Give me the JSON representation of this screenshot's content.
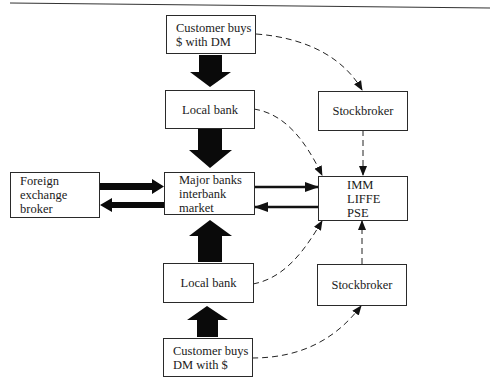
{
  "diagram": {
    "nodes": {
      "customer_top": {
        "lines": [
          "Customer buys",
          "$ with DM"
        ]
      },
      "local_bank_top": {
        "label": "Local bank"
      },
      "stockbroker_top": {
        "label": "Stockbroker"
      },
      "fx_broker": {
        "lines": [
          "Foreign",
          "exchange",
          "broker"
        ]
      },
      "major_banks": {
        "lines": [
          "Major banks",
          "interbank",
          "market"
        ]
      },
      "exchanges": {
        "lines": [
          "IMM",
          "LIFFE",
          "PSE"
        ]
      },
      "local_bank_bottom": {
        "label": "Local bank"
      },
      "stockbroker_bottom": {
        "label": "Stockbroker"
      },
      "customer_bottom": {
        "lines": [
          "Customer buys",
          "DM with $"
        ]
      }
    },
    "edges": [
      {
        "from": "customer_top",
        "to": "local_bank_top",
        "style": "thick-solid"
      },
      {
        "from": "local_bank_top",
        "to": "major_banks",
        "style": "thick-solid"
      },
      {
        "from": "local_bank_bottom",
        "to": "major_banks",
        "style": "thick-solid"
      },
      {
        "from": "customer_bottom",
        "to": "local_bank_bottom",
        "style": "thick-solid"
      },
      {
        "from": "fx_broker",
        "to": "major_banks",
        "style": "medium-solid"
      },
      {
        "from": "major_banks",
        "to": "fx_broker",
        "style": "medium-solid"
      },
      {
        "from": "major_banks",
        "to": "exchanges",
        "style": "solid"
      },
      {
        "from": "exchanges",
        "to": "major_banks",
        "style": "solid"
      },
      {
        "from": "customer_top",
        "to": "stockbroker_top",
        "style": "dashed"
      },
      {
        "from": "local_bank_top",
        "to": "exchanges",
        "style": "dashed"
      },
      {
        "from": "stockbroker_top",
        "to": "exchanges",
        "style": "dashed"
      },
      {
        "from": "local_bank_bottom",
        "to": "exchanges",
        "style": "dashed"
      },
      {
        "from": "stockbroker_bottom",
        "to": "exchanges",
        "style": "dashed"
      },
      {
        "from": "customer_bottom",
        "to": "stockbroker_bottom",
        "style": "dashed"
      }
    ]
  }
}
